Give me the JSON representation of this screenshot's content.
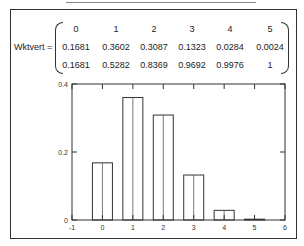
{
  "matrix": {
    "name": "Wktvert =",
    "rows": [
      [
        "0",
        "1",
        "2",
        "3",
        "4",
        "5"
      ],
      [
        "0.1681",
        "0.3602",
        "0.3087",
        "0.1323",
        "0.0284",
        "0.0024"
      ],
      [
        "0.1681",
        "0.5282",
        "0.8369",
        "0.9692",
        "0.9976",
        "1"
      ]
    ]
  },
  "chart_data": {
    "type": "bar",
    "title": "",
    "xlabel": "",
    "ylabel": "",
    "categories": [
      "0",
      "1",
      "2",
      "3",
      "4",
      "5"
    ],
    "values": [
      0.1681,
      0.3602,
      0.3087,
      0.1323,
      0.0284,
      0.0024
    ],
    "xlim": [
      -1,
      6
    ],
    "ylim": [
      0,
      0.4
    ],
    "xticks": [
      "-1",
      "0",
      "1",
      "2",
      "3",
      "4",
      "5",
      "6"
    ],
    "yticks": [
      "0",
      "0.2",
      "0.4"
    ],
    "grid": false,
    "legend": null
  }
}
